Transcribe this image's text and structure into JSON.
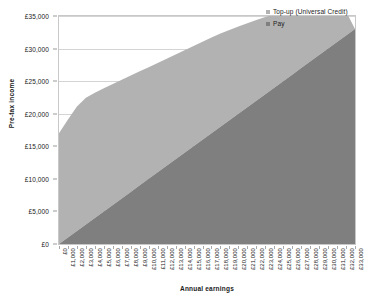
{
  "chart_data": {
    "type": "area",
    "stacked": true,
    "title": "",
    "xlabel": "Annual earnings",
    "ylabel": "Pre-tax income",
    "xlim": [
      0,
      33000
    ],
    "ylim": [
      0,
      35000
    ],
    "grid": true,
    "legend_position": "top-right",
    "colors": {
      "topup": "#b2b2b2",
      "pay": "#7f7f7f",
      "gridline": "#d4d4d4",
      "frame": "#c8c8c8"
    },
    "x": [
      0,
      1000,
      2000,
      3000,
      4000,
      5000,
      6000,
      7000,
      8000,
      9000,
      10000,
      11000,
      12000,
      13000,
      14000,
      15000,
      16000,
      17000,
      18000,
      19000,
      20000,
      21000,
      22000,
      23000,
      24000,
      25000,
      26000,
      27000,
      28000,
      29000,
      30000,
      31000,
      32000,
      33000
    ],
    "categories": [
      "£0",
      "£1,000",
      "£2,000",
      "£3,000",
      "£4,000",
      "£5,000",
      "£6,000",
      "£7,000",
      "£8,000",
      "£9,000",
      "£10,000",
      "£11,000",
      "£12,000",
      "£13,000",
      "£14,000",
      "£15,000",
      "£16,000",
      "£17,000",
      "£18,000",
      "£19,000",
      "£20,000",
      "£21,000",
      "£22,000",
      "£23,000",
      "£24,000",
      "£25,000",
      "£26,000",
      "£27,000",
      "£28,000",
      "£29,000",
      "£30,000",
      "£31,000",
      "£32,000",
      "£33,000"
    ],
    "ytick_labels": [
      "£0",
      "£5,000",
      "£10,000",
      "£15,000",
      "£20,000",
      "£25,000",
      "£30,000",
      "£35,000"
    ],
    "ytick_values": [
      0,
      5000,
      10000,
      15000,
      20000,
      25000,
      30000,
      35000
    ],
    "series": [
      {
        "name": "Pay",
        "key": "pay",
        "color": "#7f7f7f",
        "values": [
          0,
          1000,
          2000,
          3000,
          4000,
          5000,
          6000,
          7000,
          8000,
          9000,
          10000,
          11000,
          12000,
          13000,
          14000,
          15000,
          16000,
          17000,
          18000,
          19000,
          20000,
          21000,
          22000,
          23000,
          24000,
          25000,
          26000,
          27000,
          28000,
          29000,
          30000,
          31000,
          32000,
          33000
        ]
      },
      {
        "name": "Top-up (Universal Credit)",
        "key": "topup",
        "color": "#b2b2b2",
        "values": [
          17000,
          18100,
          19100,
          19450,
          19200,
          18900,
          18550,
          18200,
          17850,
          17500,
          17150,
          16800,
          16450,
          16100,
          15750,
          15400,
          15050,
          14700,
          14300,
          13850,
          13400,
          12900,
          12400,
          11850,
          11250,
          10600,
          9900,
          9150,
          8300,
          7400,
          6400,
          5200,
          3700,
          0
        ]
      }
    ],
    "stack_totals": [
      17000,
      19100,
      21100,
      22450,
      23200,
      23900,
      24550,
      25200,
      25850,
      26500,
      27150,
      27800,
      28450,
      29100,
      29750,
      30400,
      31050,
      31700,
      32300,
      32850,
      33400,
      33900,
      34400,
      34850,
      35250,
      35600,
      35900,
      36150,
      36300,
      36400,
      36400,
      36200,
      35700,
      33000
    ]
  },
  "legend": {
    "items": [
      {
        "label": "Top-up (Universal Credit)",
        "color": "#b2b2b2"
      },
      {
        "label": "Pay",
        "color": "#7f7f7f"
      }
    ]
  }
}
